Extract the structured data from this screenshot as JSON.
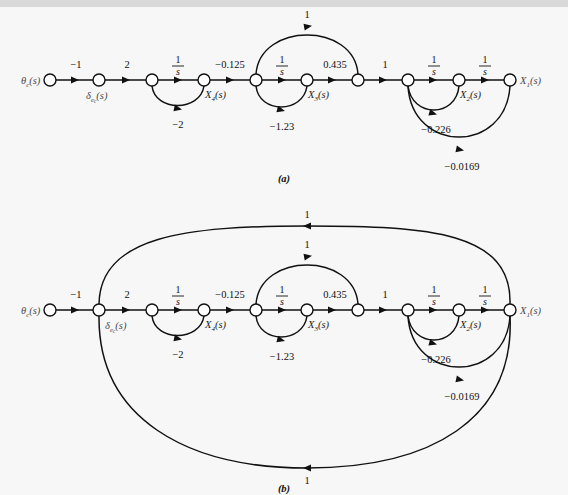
{
  "figure": {
    "type": "signal-flow-graph",
    "background_color": "#f7f7f7",
    "line_color": "#111111",
    "panels": [
      {
        "id": "a",
        "caption": "(a)",
        "input_node_label": "θ",
        "input_node_sub": "c",
        "input_node_tail": "(s)",
        "output_node_label": "X",
        "output_node_sub": "1",
        "output_node_tail": "(s)",
        "forward_gains": [
          "−1",
          "2",
          "1/s",
          "−0.125",
          "1/s",
          "0.435",
          "1",
          "1/s",
          "1/s"
        ],
        "forward_gain_texts": [
          "−1",
          "2",
          "",
          "−0.125",
          "",
          "0.435",
          "1",
          "",
          ""
        ],
        "feedback_gains": [
          "−2",
          "−1.23",
          "1",
          "−0.226",
          "−0.0169"
        ],
        "interior_labels": [
          "δ",
          "X4(s)",
          "X3(s)",
          "X2(s)"
        ]
      },
      {
        "id": "b",
        "caption": "(b)",
        "extra_feedback_gains": [
          "1",
          "1"
        ],
        "outer_loop_top_label": "1",
        "outer_loop_bottom_label": "1"
      }
    ]
  },
  "labels": {
    "minus_one": "−1",
    "two": "2",
    "one": "1",
    "minus_0125": "−0.125",
    "p0435": "0.435",
    "minus_2": "−2",
    "minus_123": "−1.23",
    "minus_0226": "−0.226",
    "minus_00169": "−0.0169",
    "frac_num": "1",
    "frac_den": "s",
    "theta_glyph": "θ",
    "delta_glyph": "δ",
    "paren_s": "(s)",
    "sub_c": "c",
    "sub_e": "e",
    "sub_X1": "1",
    "sub_X2": "2",
    "sub_X3": "3",
    "sub_X4": "4",
    "X_glyph": "X",
    "caption_a": "(a)",
    "caption_b": "(b)"
  }
}
